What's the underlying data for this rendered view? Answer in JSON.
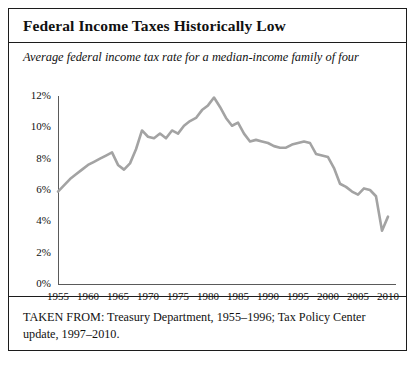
{
  "figure": {
    "title": "Federal Income Taxes Historically Low",
    "subtitle": "Average federal income tax rate for a median-income family of four",
    "source_note": "TAKEN FROM: Treasury Department, 1955–1996; Tax Policy Center update, 1997–2010.",
    "border_color": "#1c1c1c",
    "background_color": "#ffffff"
  },
  "chart_data": {
    "type": "line",
    "title": "Federal Income Taxes Historically Low",
    "subtitle": "Average federal income tax rate for a median-income family of four",
    "xlabel": "",
    "ylabel": "",
    "line_color": "#a3a3a3",
    "grid": false,
    "legend": false,
    "xlim": [
      1955,
      2011
    ],
    "ylim": [
      0,
      12
    ],
    "xticks": [
      1955,
      1960,
      1965,
      1970,
      1975,
      1980,
      1985,
      1990,
      1995,
      2000,
      2005,
      2010
    ],
    "xtick_labels": [
      "1955",
      "1960",
      "1965",
      "1970",
      "1975",
      "1980",
      "1985",
      "1990",
      "1995",
      "2000",
      "2005",
      "2010"
    ],
    "yticks": [
      0,
      2,
      4,
      6,
      8,
      10,
      12
    ],
    "ytick_labels": [
      "0%",
      "2%",
      "4%",
      "6%",
      "8%",
      "10%",
      "12%"
    ],
    "series": [
      {
        "name": "Average federal income tax rate, median-income family of four",
        "x": [
          1955,
          1956,
          1957,
          1958,
          1959,
          1960,
          1961,
          1962,
          1963,
          1964,
          1965,
          1966,
          1967,
          1968,
          1969,
          1970,
          1971,
          1972,
          1973,
          1974,
          1975,
          1976,
          1977,
          1978,
          1979,
          1980,
          1981,
          1982,
          1983,
          1984,
          1985,
          1986,
          1987,
          1988,
          1989,
          1990,
          1991,
          1992,
          1993,
          1994,
          1995,
          1996,
          1997,
          1998,
          1999,
          2000,
          2001,
          2002,
          2003,
          2004,
          2005,
          2006,
          2007,
          2008,
          2009,
          2010
        ],
        "values": [
          5.9,
          6.3,
          6.7,
          7.0,
          7.3,
          7.6,
          7.8,
          8.0,
          8.2,
          8.4,
          7.6,
          7.3,
          7.7,
          8.6,
          9.8,
          9.4,
          9.3,
          9.6,
          9.3,
          9.8,
          9.6,
          10.1,
          10.4,
          10.6,
          11.1,
          11.4,
          11.9,
          11.3,
          10.6,
          10.1,
          10.3,
          9.6,
          9.1,
          9.2,
          9.1,
          9.0,
          8.8,
          8.7,
          8.7,
          8.9,
          9.0,
          9.1,
          9.0,
          8.3,
          8.2,
          8.1,
          7.4,
          6.4,
          6.2,
          5.9,
          5.7,
          6.1,
          6.0,
          5.6,
          3.4,
          4.3
        ]
      }
    ]
  },
  "axes": {
    "y_axis_name": "percent-axis",
    "x_axis_name": "year-axis"
  }
}
